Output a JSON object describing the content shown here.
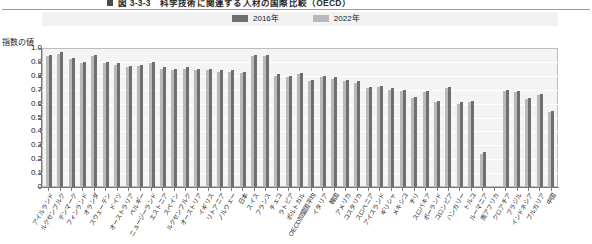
{
  "figure": {
    "title": "図 3-3-3　科学技術に関連する人材の国際比較（OECD）",
    "title_marker": "square-marker"
  },
  "legend": {
    "position": "top-center",
    "items": [
      {
        "label": "2016年",
        "color": "#6f6f6f"
      },
      {
        "label": "2022年",
        "color": "#b9b9b9"
      }
    ]
  },
  "axis": {
    "ylabel": "指数の値",
    "yticks": [
      "1.0",
      "0.9",
      "0.8",
      "0.7",
      "0.6",
      "0.5",
      "0.4",
      "0.3",
      "0.2",
      "0.1",
      "0"
    ]
  },
  "chart_data": {
    "type": "bar",
    "title": "図 3-3-3　科学技術に関連する人材の国際比較（OECD）",
    "xlabel": "",
    "ylabel": "指数の値",
    "ylim": [
      0,
      1.0
    ],
    "grid": true,
    "legend_position": "top-center",
    "categories": [
      "アイルランド",
      "ルクセンブルク",
      "デンマーク",
      "フィンランド",
      "オランダ",
      "スウェーデン",
      "ドイツ",
      "オーストラリア",
      "ベルギー",
      "ニュージーランド",
      "エストニア",
      "スペイン",
      "ルクセンブルク",
      "オーストリア",
      "イギリス",
      "リトアニア",
      "ノルウェー",
      "日本",
      "スイス",
      "フランス",
      "チェコ",
      "ラトビア",
      "ポルトガル",
      "OECD加盟国平均",
      "イタリア",
      "韓国",
      "アメリカ",
      "コスタリカ",
      "スロベニア",
      "アイスランド",
      "ギリシャ",
      "メキシコ",
      "チリ",
      "スロバキア",
      "ポーランド",
      "コロンビア",
      "ハンガリー",
      "トルコ",
      "ルーマニア",
      "南アフリカ",
      "クロアチア",
      "ブラジル",
      "インドネシア",
      "ブルガリア",
      "中国"
    ],
    "series": [
      {
        "name": "2016年",
        "color": "#6f6f6f",
        "values": [
          0.95,
          0.97,
          0.93,
          0.9,
          0.95,
          0.9,
          0.89,
          0.87,
          0.88,
          0.9,
          0.86,
          0.85,
          0.86,
          0.85,
          0.85,
          0.84,
          0.84,
          0.83,
          0.95,
          0.95,
          0.81,
          0.8,
          0.82,
          0.77,
          0.8,
          0.79,
          0.77,
          0.76,
          0.72,
          0.73,
          0.71,
          0.7,
          0.65,
          0.69,
          0.62,
          0.72,
          0.61,
          0.62,
          0.25,
          0.0,
          0.7,
          0.69,
          0.64,
          0.67,
          0.55
        ]
      },
      {
        "name": "2022年",
        "color": "#b9b9b9",
        "values": [
          0.94,
          0.96,
          0.92,
          0.89,
          0.94,
          0.89,
          0.88,
          0.86,
          0.87,
          0.89,
          0.85,
          0.84,
          0.85,
          0.84,
          0.84,
          0.83,
          0.83,
          0.82,
          0.94,
          0.94,
          0.8,
          0.79,
          0.81,
          0.76,
          0.79,
          0.78,
          0.76,
          0.75,
          0.71,
          0.72,
          0.7,
          0.69,
          0.64,
          0.68,
          0.61,
          0.71,
          0.6,
          0.61,
          0.24,
          0.0,
          0.69,
          0.68,
          0.63,
          0.66,
          0.54
        ]
      }
    ],
    "bar_heights": [
      0.95,
      0.97,
      0.93,
      0.9,
      0.95,
      0.9,
      0.89,
      0.87,
      0.88,
      0.9,
      0.86,
      0.85,
      0.86,
      0.85,
      0.85,
      0.84,
      0.84,
      0.83,
      0.95,
      0.95,
      0.81,
      0.8,
      0.82,
      0.77,
      0.8,
      0.79,
      0.77,
      0.76,
      0.72,
      0.73,
      0.71,
      0.7,
      0.65,
      0.69,
      0.62,
      0.72,
      0.61,
      0.62,
      0.25,
      0.0,
      0.7,
      0.69,
      0.64,
      0.67,
      0.55
    ]
  }
}
